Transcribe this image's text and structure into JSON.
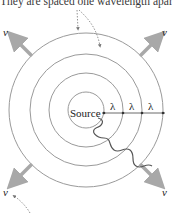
{
  "caption": "They are spaced one wavelength apart.",
  "source_label": "Source",
  "wavelength_symbol": "λ",
  "velocity_symbol": "v",
  "wavelength_labels": [
    "λ",
    "λ",
    "λ"
  ],
  "velocity_labels": [
    "v",
    "v",
    "v",
    "v"
  ],
  "colors": {
    "wavefront": "#9a9a9a",
    "arrow": "#a8a8a8",
    "wave": "#555555",
    "leader": "#888888",
    "text": "#222222"
  }
}
